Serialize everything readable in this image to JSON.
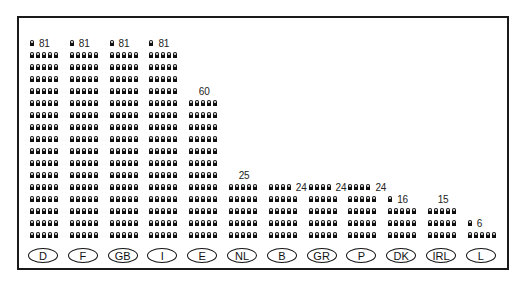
{
  "chart_data": {
    "type": "pictogram-bar",
    "title": "",
    "xlabel": "",
    "ylabel": "",
    "icon": "person-icon",
    "icons_per_row": 5,
    "categories": [
      "D",
      "F",
      "GB",
      "I",
      "E",
      "NL",
      "B",
      "GR",
      "P",
      "DK",
      "IRL",
      "L"
    ],
    "values": [
      81,
      81,
      81,
      81,
      60,
      25,
      24,
      24,
      24,
      16,
      15,
      6
    ],
    "grid": false,
    "legend": false
  }
}
